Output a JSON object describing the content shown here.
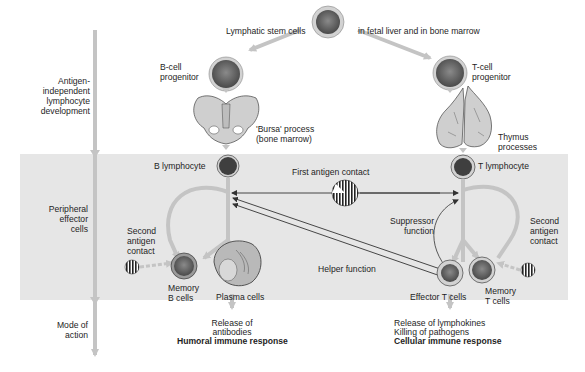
{
  "diagram": {
    "colors": {
      "band": "#e6e6e6",
      "arrow": "#c4c4c4",
      "cell_ring": "#d2d2d2",
      "cell_core": "#5a5a5a",
      "organ": "#c9c9c9",
      "line": "#333333"
    },
    "stages": [
      {
        "id": "antigen-independent",
        "label": "Antigen-\nindependent\nlymphocyte\ndevelopment"
      },
      {
        "id": "peripheral",
        "label": "Peripheral\neffector\ncells"
      },
      {
        "id": "mode",
        "label": "Mode of\naction"
      }
    ],
    "nodes": {
      "stem": {
        "label": "Lymphatic stem cells",
        "location": "in fetal liver and in bone marrow"
      },
      "b_progenitor": {
        "label": "B-cell\nprogenitor"
      },
      "t_progenitor": {
        "label": "T-cell\nprogenitor"
      },
      "bursa": {
        "label": "'Bursa' process\n(bone marrow)"
      },
      "thymus": {
        "label": "Thymus\nprocesses"
      },
      "b_lymphocyte": {
        "label": "B lymphocyte"
      },
      "t_lymphocyte": {
        "label": "T lymphocyte"
      },
      "first_antigen": {
        "label": "First antigen contact"
      },
      "suppressor": {
        "label": "Suppressor\nfunction"
      },
      "helper": {
        "label": "Helper function"
      },
      "second_antigen_b": {
        "label": "Second\nantigen\ncontact"
      },
      "second_antigen_t": {
        "label": "Second\nantigen\ncontact"
      },
      "memory_b": {
        "label": "Memory\nB cells"
      },
      "plasma": {
        "label": "Plasma cells"
      },
      "effector_t": {
        "label": "Effector T cells"
      },
      "memory_t": {
        "label": "Memory\nT cells"
      }
    },
    "outcomes": {
      "humoral": {
        "lines": [
          "Release of",
          "antibodies"
        ],
        "response": "Humoral immune response"
      },
      "cellular": {
        "lines": [
          "Release of lymphokines",
          "Killing of pathogens"
        ],
        "response": "Cellular immune response"
      }
    }
  }
}
